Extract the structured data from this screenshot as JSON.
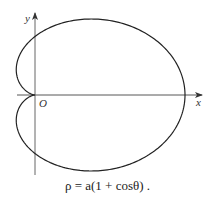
{
  "figure": {
    "type": "polar-curve-diagram",
    "curve_name": "cardioid",
    "equation": "ρ = a(1 + cosθ) .",
    "axes": {
      "x_label": "x",
      "y_label": "y",
      "origin_label": "O"
    },
    "colors": {
      "curve": "#222222",
      "axes": "#444444",
      "background": "#ffffff"
    }
  }
}
